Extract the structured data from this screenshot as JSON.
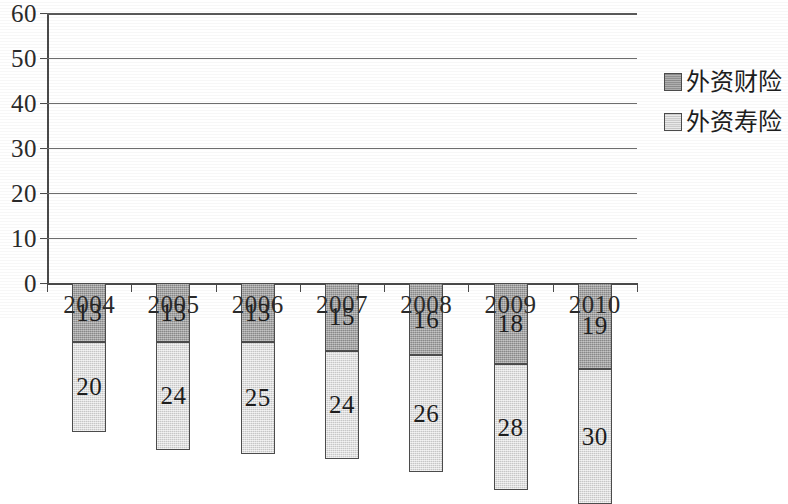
{
  "chart_data": {
    "type": "bar",
    "stacked": true,
    "title": "",
    "subtitle": "",
    "xlabel": "",
    "ylabel": "",
    "categories": [
      "2004",
      "2005",
      "2006",
      "2007",
      "2008",
      "2009",
      "2010"
    ],
    "series": [
      {
        "name": "外资寿险",
        "color": "#d4d4d4",
        "stack_order": 0,
        "values": [
          20,
          24,
          25,
          24,
          26,
          28,
          30
        ]
      },
      {
        "name": "外资财险",
        "color": "#989898",
        "stack_order": 1,
        "values": [
          13,
          13,
          13,
          15,
          16,
          18,
          19
        ]
      }
    ],
    "totals": [
      33,
      37,
      38,
      39,
      42,
      46,
      49
    ],
    "ylim": [
      0,
      60
    ],
    "ytick_step": 10,
    "yticks": [
      "0",
      "10",
      "20",
      "30",
      "40",
      "50",
      "60"
    ],
    "grid": true,
    "grid_axis": "y",
    "legend_position": "right",
    "data_labels": true
  },
  "legend": {
    "items": [
      {
        "label": "外资财险",
        "swatch": "dark"
      },
      {
        "label": "外资寿险",
        "swatch": "light"
      }
    ]
  },
  "colors": {
    "series_light": "#d4d4d4",
    "series_dark": "#989898",
    "axis": "#4a4a4a",
    "gridline": "#6d6d6d",
    "text": "#1d1d1d",
    "background": "#ffffff"
  }
}
